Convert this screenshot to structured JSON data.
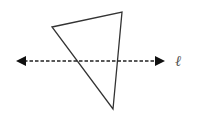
{
  "diagram": {
    "type": "geometry",
    "stroke_color": "#333333",
    "label_color": "#555555",
    "triangle": {
      "vertices": [
        {
          "x": 52,
          "y": 27
        },
        {
          "x": 122,
          "y": 12
        },
        {
          "x": 113,
          "y": 109
        }
      ]
    },
    "line": {
      "label": "ℓ",
      "style": "dashed",
      "start": {
        "x": 16,
        "y": 61
      },
      "end": {
        "x": 165,
        "y": 61
      },
      "arrowheads": "both"
    }
  }
}
